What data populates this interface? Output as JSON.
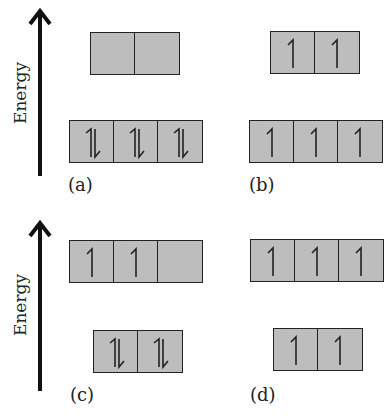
{
  "axis_label": "Energy",
  "panels": [
    {
      "label": "(a)",
      "upper": [
        "empty",
        "empty"
      ],
      "lower": [
        "pair",
        "pair",
        "pair"
      ]
    },
    {
      "label": "(b)",
      "upper": [
        "up",
        "up"
      ],
      "lower": [
        "up",
        "up",
        "up"
      ]
    },
    {
      "label": "(c)",
      "upper": [
        "up",
        "up",
        "empty"
      ],
      "lower": [
        "pair",
        "pair"
      ]
    },
    {
      "label": "(d)",
      "upper": [
        "up",
        "up",
        "up"
      ],
      "lower": [
        "up",
        "up"
      ]
    }
  ],
  "colors": {
    "box_fill": "#bdbdbd",
    "line": "#222222"
  }
}
